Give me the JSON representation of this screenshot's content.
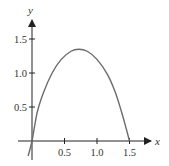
{
  "chart_data": {
    "type": "line",
    "title": "",
    "xlabel": "x",
    "ylabel": "y",
    "x_ticks": [
      {
        "value": 0.5,
        "label": "0.5"
      },
      {
        "value": 1.0,
        "label": "1.0"
      },
      {
        "value": 1.5,
        "label": "1.5"
      }
    ],
    "y_ticks": [
      {
        "value": 0.5,
        "label": "0.5"
      },
      {
        "value": 1.0,
        "label": "1.0"
      },
      {
        "value": 1.5,
        "label": "1.5"
      }
    ],
    "xlim": [
      -0.2,
      1.85
    ],
    "ylim": [
      -0.28,
      1.8
    ],
    "grid": false,
    "legend": null,
    "series": [
      {
        "name": "curve",
        "color": "#6b6b6b",
        "points": [
          [
            -0.06,
            -0.22
          ],
          [
            0.0,
            0.0
          ],
          [
            0.08,
            0.42
          ],
          [
            0.18,
            0.72
          ],
          [
            0.31,
            1.0
          ],
          [
            0.45,
            1.2
          ],
          [
            0.6,
            1.32
          ],
          [
            0.72,
            1.35
          ],
          [
            0.85,
            1.32
          ],
          [
            1.0,
            1.2
          ],
          [
            1.16,
            0.98
          ],
          [
            1.28,
            0.72
          ],
          [
            1.38,
            0.42
          ],
          [
            1.45,
            0.18
          ],
          [
            1.5,
            0.0
          ]
        ]
      }
    ]
  },
  "colors": {
    "axis": "#222222",
    "curve": "#6b6b6b",
    "text": "#333333"
  }
}
